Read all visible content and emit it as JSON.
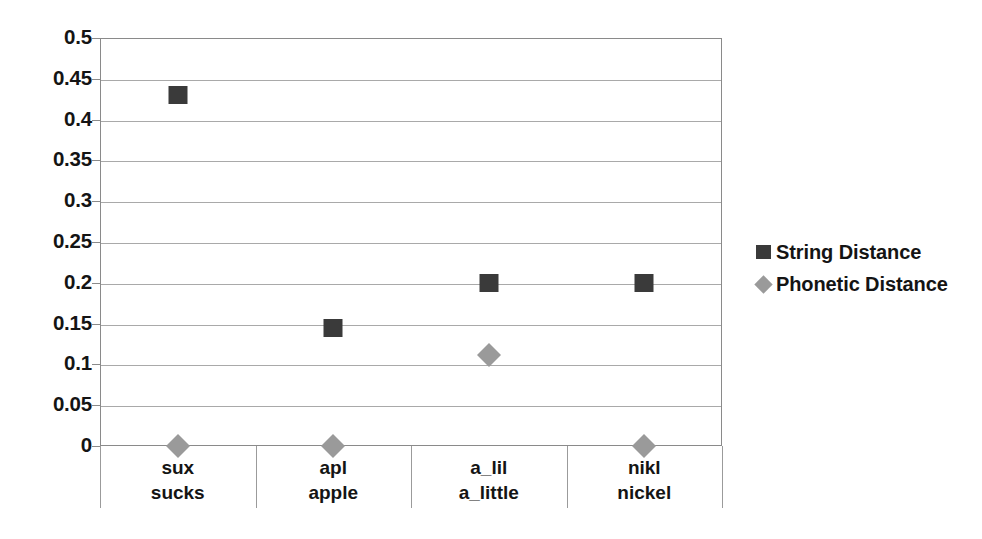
{
  "chart_data": {
    "type": "scatter",
    "title": "",
    "subtitle": "",
    "xlabel": "",
    "ylabel": "",
    "ylim": [
      0,
      0.5
    ],
    "y_ticks": [
      0,
      0.05,
      0.1,
      0.15,
      0.2,
      0.25,
      0.3,
      0.35,
      0.4,
      0.45,
      0.5
    ],
    "y_tick_labels": [
      "0",
      "0.05",
      "0.1",
      "0.15",
      "0.2",
      "0.25",
      "0.3",
      "0.35",
      "0.4",
      "0.45",
      "0.5"
    ],
    "grid": true,
    "grid_axis": "y",
    "legend_position": "right",
    "categories": [
      "sux\nsucks",
      "apl\napple",
      "a_lil\na_little",
      "nikl\nnickel"
    ],
    "category_tokens": [
      {
        "misspelling": "sux",
        "word": "sucks"
      },
      {
        "misspelling": "apl",
        "word": "apple"
      },
      {
        "misspelling": "a_lil",
        "word": "a_little"
      },
      {
        "misspelling": "nikl",
        "word": "nickel"
      }
    ],
    "series": [
      {
        "name": "String Distance",
        "marker": "square",
        "color": "#3a3a3a",
        "values": [
          0.43,
          0.145,
          0.2,
          0.2
        ]
      },
      {
        "name": "Phonetic Distance",
        "marker": "diamond",
        "color": "#9a9a9a",
        "values": [
          0,
          0,
          0.112,
          0
        ]
      }
    ]
  },
  "legend": {
    "items": [
      {
        "label": "String Distance",
        "marker": "square",
        "color": "#3a3a3a"
      },
      {
        "label": "Phonetic Distance",
        "marker": "diamond",
        "color": "#9a9a9a"
      }
    ]
  },
  "style": {
    "axis_color": "#8a8a8a",
    "gridline_color": "#a9a9a9",
    "text_color": "#141414",
    "background": "#ffffff"
  }
}
